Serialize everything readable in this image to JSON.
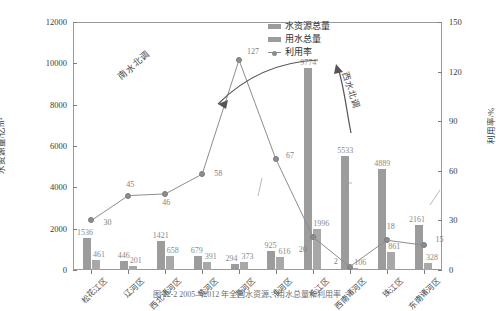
{
  "chart_data": {
    "type": "bar",
    "title": "",
    "xlabel": "",
    "ylabel": "水资源量/亿m³",
    "y2label": "利用率/%",
    "ylim": [
      0,
      12000
    ],
    "y2lim": [
      0,
      150
    ],
    "yticks": [
      0,
      2000,
      4000,
      6000,
      8000,
      10000,
      12000
    ],
    "y2ticks": [
      0,
      30,
      60,
      90,
      120,
      150
    ],
    "grid": false,
    "legend_position": "top-right",
    "categories": [
      "松花江区",
      "辽河区",
      "西北诸河区",
      "黄河区",
      "海河区",
      "淮河区",
      "长江区",
      "西南诸河区",
      "珠江区",
      "东南诸河区"
    ],
    "series": [
      {
        "name": "水资源总量",
        "unit": "亿m³",
        "axis": "left",
        "type": "bar",
        "values": [
          1536,
          446,
          1421,
          679,
          294,
          925,
          9774,
          5533,
          4889,
          2161
        ]
      },
      {
        "name": "用水总量",
        "unit": "亿m³",
        "axis": "left",
        "type": "bar",
        "values": [
          461,
          201,
          658,
          391,
          373,
          616,
          1996,
          106,
          861,
          328
        ]
      },
      {
        "name": "利用率",
        "unit": "%",
        "axis": "right",
        "type": "line",
        "values": [
          30,
          45,
          46,
          58,
          127,
          67,
          20,
          2,
          18,
          15
        ]
      }
    ],
    "annotations": [
      {
        "text": "南水北调",
        "target": "海河区"
      },
      {
        "text": "西水北调",
        "target": "西南诸河区"
      }
    ]
  },
  "legend": {
    "items": [
      {
        "label": "水资源总量",
        "marker": "bar-swatch"
      },
      {
        "label": "用水总量",
        "marker": "bar-swatch"
      },
      {
        "label": "利用率",
        "marker": "line-dot"
      }
    ]
  },
  "caption": {
    "text": "图 22-2   2005—2012 年全国水资源、用水总量和利用率"
  },
  "colors": {
    "bar_resource": "#9c9c9c",
    "bar_use": "#a8a8a8",
    "line": "#8d8d8d",
    "axis": "#9a9a9a",
    "label_text": "#8a8a8a"
  }
}
